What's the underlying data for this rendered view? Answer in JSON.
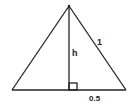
{
  "diagram": {
    "type": "isosceles-triangle-altitude",
    "labels": {
      "height": "h",
      "side": "1",
      "half_base": "0.5"
    },
    "colors": {
      "stroke": "#222222",
      "background": "#ffffff"
    }
  }
}
